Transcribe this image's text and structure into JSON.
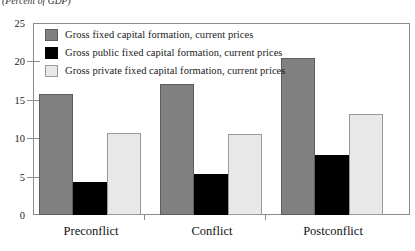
{
  "chart_data": {
    "type": "bar",
    "title": "",
    "subtitle": "(Percent of GDP)",
    "xlabel": "",
    "ylabel": "",
    "ylim": [
      0,
      25
    ],
    "yticks": [
      0,
      5,
      10,
      15,
      20,
      25
    ],
    "ytick_labels": [
      "0",
      "5",
      "10",
      "15",
      "20",
      "25"
    ],
    "grid": false,
    "legend_position": "top-left-inside",
    "categories": [
      "Preconflict",
      "Conflict",
      "Postconflict"
    ],
    "series": [
      {
        "name": "Gross fixed capital formation, current prices",
        "color": "#808080",
        "values": [
          15.8,
          17.1,
          20.4
        ]
      },
      {
        "name": "Gross public fixed capital formation, current prices",
        "color": "#000000",
        "values": [
          4.3,
          5.3,
          7.8
        ]
      },
      {
        "name": "Gross private fixed capital formation, current prices",
        "color": "#e8e8e8",
        "values": [
          10.7,
          10.6,
          13.1
        ]
      }
    ]
  },
  "axis": {
    "y_tick_0": "0",
    "y_tick_5": "5",
    "y_tick_10": "10",
    "y_tick_15": "15",
    "y_tick_20": "20",
    "y_tick_25": "25"
  },
  "legend": {
    "items": [
      {
        "label": "Gross fixed capital formation, current prices"
      },
      {
        "label": "Gross public fixed capital formation, current prices"
      },
      {
        "label": "Gross private fixed capital formation, current prices"
      }
    ]
  },
  "caption": {
    "units": "(Percent of GDP)"
  }
}
